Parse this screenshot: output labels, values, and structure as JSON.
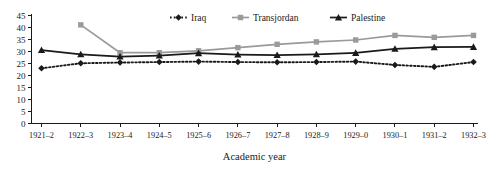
{
  "chart_data": {
    "type": "line",
    "title": "",
    "xlabel": "Academic year",
    "ylabel": "",
    "ylim": [
      0,
      45
    ],
    "yticks": [
      0,
      5,
      10,
      15,
      20,
      25,
      30,
      35,
      40,
      45
    ],
    "grid": false,
    "legend_position": "top-right",
    "categories": [
      "1921–2",
      "1922–3",
      "1923–4",
      "1924–5",
      "1925–6",
      "1926–7",
      "1927–8",
      "1928–9",
      "1929–0",
      "1930–1",
      "1931–2",
      "1932–3"
    ],
    "series": [
      {
        "name": "Iraq",
        "color": "#1a1a1a",
        "marker": "diamond",
        "line_style": "dotted",
        "values": [
          23.0,
          25.1,
          25.4,
          25.6,
          25.8,
          25.6,
          25.5,
          25.6,
          25.8,
          24.4,
          23.6,
          25.6
        ]
      },
      {
        "name": "Transjordan",
        "color": "#9a9a9a",
        "marker": "square",
        "line_style": "solid",
        "values": [
          null,
          41.1,
          29.5,
          29.5,
          30.3,
          31.6,
          33.0,
          34.0,
          34.8,
          36.7,
          35.9,
          36.7
        ]
      },
      {
        "name": "Palestine",
        "color": "#1a1a1a",
        "marker": "triangle",
        "line_style": "solid",
        "values": [
          30.6,
          28.8,
          27.9,
          28.3,
          29.3,
          28.7,
          28.5,
          28.8,
          29.4,
          31.1,
          31.8,
          31.9
        ]
      }
    ]
  },
  "legend": {
    "items": [
      {
        "label": "Iraq"
      },
      {
        "label": "Transjordan"
      },
      {
        "label": "Palestine"
      }
    ]
  }
}
